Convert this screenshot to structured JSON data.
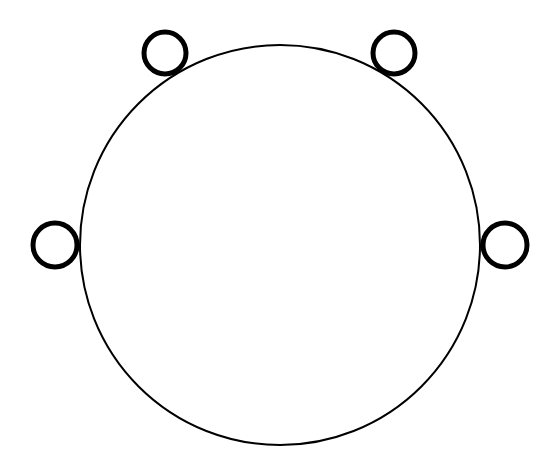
{
  "diagram": {
    "background": "#ffffff",
    "stroke_color": "#000000",
    "main_circle": {
      "cx": 280,
      "cy": 245,
      "r": 200,
      "stroke_width": 2
    },
    "small_circles": [
      {
        "name": "top-left",
        "cx": 165,
        "cy": 53,
        "r": 21,
        "stroke_width": 5
      },
      {
        "name": "top-right",
        "cx": 394,
        "cy": 53,
        "r": 21,
        "stroke_width": 5
      },
      {
        "name": "left",
        "cx": 55,
        "cy": 245,
        "r": 22,
        "stroke_width": 5
      },
      {
        "name": "right",
        "cx": 505,
        "cy": 245,
        "r": 22,
        "stroke_width": 5
      }
    ]
  }
}
